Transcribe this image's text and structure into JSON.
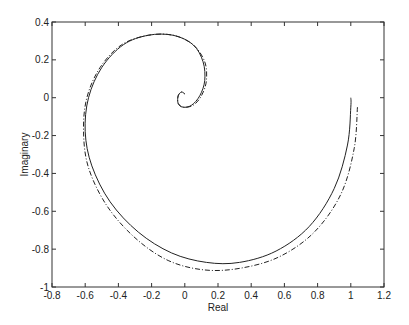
{
  "chart_data": {
    "type": "line",
    "title": "",
    "xlabel": "Real",
    "ylabel": "Imaginary",
    "xlim": [
      -0.8,
      1.2
    ],
    "ylim": [
      -1,
      0.4
    ],
    "xticks": [
      -0.8,
      -0.6,
      -0.4,
      -0.2,
      0,
      0.2,
      0.4,
      0.6,
      0.8,
      1,
      1.2
    ],
    "xtick_labels": [
      "-0.8",
      "-0.6",
      "-0.4",
      "-0.2",
      "0",
      "0.2",
      "0.4",
      "0.6",
      "0.8",
      "1",
      "1.2"
    ],
    "yticks": [
      0.4,
      0.2,
      0,
      -0.2,
      -0.4,
      -0.6,
      -0.8,
      -1
    ],
    "ytick_labels": [
      "0.4",
      "0.2",
      "0",
      "-0.2",
      "-0.4",
      "-0.6",
      "-0.8",
      "-1"
    ],
    "grid": false,
    "legend": "none",
    "series": [
      {
        "name": "solid",
        "style": "solid",
        "color": "#222222",
        "x": [
          1.0,
          1.0,
          0.98,
          0.9,
          0.75,
          0.55,
          0.33,
          0.13,
          -0.08,
          -0.28,
          -0.45,
          -0.56,
          -0.6,
          -0.58,
          -0.5,
          -0.37,
          -0.22,
          -0.07,
          0.05,
          0.11,
          0.12,
          0.09,
          0.04,
          -0.01,
          -0.04,
          -0.04,
          -0.02,
          0.0
        ],
        "y": [
          0.0,
          -0.05,
          -0.25,
          -0.48,
          -0.68,
          -0.81,
          -0.87,
          -0.87,
          -0.82,
          -0.71,
          -0.55,
          -0.36,
          -0.18,
          0.0,
          0.16,
          0.28,
          0.33,
          0.33,
          0.28,
          0.19,
          0.09,
          0.01,
          -0.04,
          -0.05,
          -0.03,
          0.01,
          0.03,
          0.02
        ]
      },
      {
        "name": "dash-dot",
        "style": "dashdot",
        "color": "#222222",
        "x": [
          1.04,
          1.02,
          0.94,
          0.78,
          0.57,
          0.34,
          0.12,
          -0.1,
          -0.3,
          -0.47,
          -0.58,
          -0.61,
          -0.59,
          -0.51,
          -0.38,
          -0.22,
          -0.07,
          0.05,
          0.12,
          0.13,
          0.1,
          0.05,
          -0.01,
          -0.04,
          -0.04,
          -0.02,
          0.0
        ],
        "y": [
          -0.05,
          -0.27,
          -0.51,
          -0.71,
          -0.84,
          -0.9,
          -0.91,
          -0.86,
          -0.74,
          -0.57,
          -0.37,
          -0.18,
          0.0,
          0.16,
          0.28,
          0.33,
          0.33,
          0.28,
          0.19,
          0.09,
          0.01,
          -0.04,
          -0.05,
          -0.03,
          0.01,
          0.03,
          0.02
        ]
      }
    ]
  }
}
